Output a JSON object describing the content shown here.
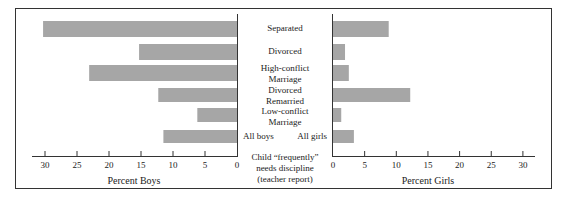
{
  "chart_data": {
    "type": "bar",
    "orientation": "horizontal",
    "layout": "back-to-back (population pyramid style)",
    "categories": [
      "Separated",
      "Divorced",
      "High-conflict Marriage",
      "Divorced Remarried",
      "Low-conflict Marriage",
      "All"
    ],
    "category_labels": [
      [
        "Separated"
      ],
      [
        "Divorced"
      ],
      [
        "High-conflict",
        "Marriage"
      ],
      [
        "Divorced",
        "Remarried"
      ],
      [
        "Low-conflict",
        "Marriage"
      ]
    ],
    "all_labels": {
      "boys": "All boys",
      "girls": "All girls"
    },
    "series": [
      {
        "name": "Percent Boys",
        "side": "left",
        "values": [
          30.3,
          15.3,
          23.1,
          12.3,
          6.2,
          11.5
        ]
      },
      {
        "name": "Percent Girls",
        "side": "right",
        "values": [
          8.8,
          1.9,
          2.5,
          12.2,
          1.3,
          3.3
        ]
      }
    ],
    "xlabel_left": "Percent Boys",
    "xlabel_right": "Percent Girls",
    "center_caption": [
      "Child “frequently”",
      "needs discipline",
      "(teacher report)"
    ],
    "ticks": [
      0,
      5,
      10,
      15,
      20,
      25,
      30
    ],
    "xlim": [
      0,
      30
    ],
    "grid": false,
    "legend": "none",
    "bar_color": "#a6a6a6",
    "frame_color": "#333333"
  }
}
